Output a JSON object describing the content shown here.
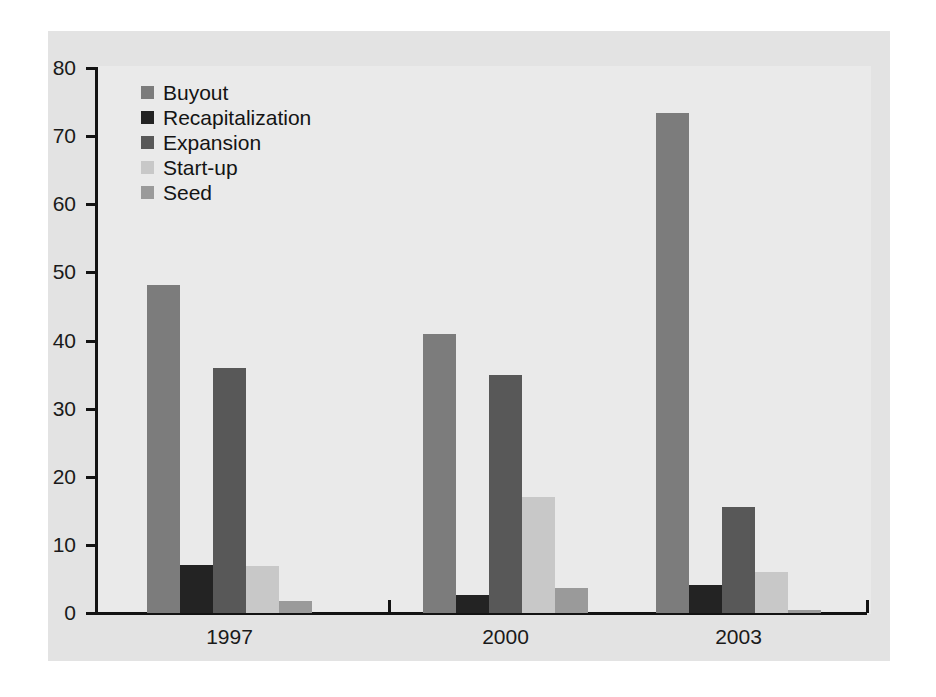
{
  "chart_data": {
    "type": "bar",
    "title": "",
    "subtitle": "",
    "xlabel": "",
    "ylabel": "",
    "categories": [
      "1997",
      "2000",
      "2003"
    ],
    "series": [
      {
        "name": "Buyout",
        "color": "#7c7c7c",
        "values": [
          48.2,
          41.0,
          73.4
        ]
      },
      {
        "name": "Recapitalization",
        "color": "#232323",
        "values": [
          7.0,
          2.6,
          4.1
        ]
      },
      {
        "name": "Expansion",
        "color": "#585858",
        "values": [
          36.0,
          35.0,
          15.6
        ]
      },
      {
        "name": "Start-up",
        "color": "#c8c8c8",
        "values": [
          6.9,
          17.0,
          6.0
        ]
      },
      {
        "name": "Seed",
        "color": "#9a9a9a",
        "values": [
          1.7,
          3.7,
          0.4
        ]
      }
    ],
    "ylim": [
      0,
      80
    ],
    "yticks": [
      0,
      10,
      20,
      30,
      40,
      50,
      60,
      70,
      80
    ],
    "ytick_labels": [
      "0",
      "10",
      "20",
      "30",
      "40",
      "50",
      "60",
      "70",
      "80"
    ],
    "grid": false,
    "legend_position": "upper-left-inside",
    "axis_color": "#131313",
    "panel_color": "#e3e3e3",
    "plot_color": "#eaeaea"
  },
  "legend": {
    "items": [
      {
        "label": "Buyout"
      },
      {
        "label": "Recapitalization"
      },
      {
        "label": "Expansion"
      },
      {
        "label": "Start-up"
      },
      {
        "label": "Seed"
      }
    ]
  },
  "axes": {
    "y_tick_labels": [
      "80",
      "70",
      "60",
      "50",
      "40",
      "30",
      "20",
      "10",
      "0"
    ],
    "x_group_labels": [
      "1997",
      "2000",
      "2003"
    ]
  }
}
